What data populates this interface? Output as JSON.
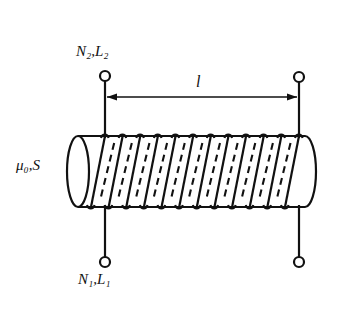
{
  "figure": {
    "kind": "solenoid-coil-schematic",
    "background_color": "#ffffff",
    "ink_color": "#111111",
    "labels": {
      "top_terminal": "N₂,L₂",
      "bottom_terminal": "N₁,L₁",
      "core": "μ₀,S",
      "length": "l"
    }
  },
  "geometry": {
    "cylinder": {
      "left_x": 67,
      "right_x": 310,
      "top_y": 136,
      "bottom_y": 207,
      "cap_rx": 11,
      "cap_ry": 36
    },
    "coil": {
      "turns": 12,
      "start_x": 105,
      "end_x": 299,
      "top_y": 136,
      "bottom_y": 207,
      "slant_dx": 14,
      "loop_radius": 4
    },
    "terminals": [
      {
        "name": "top-left",
        "cx": 105,
        "cy": 76,
        "r": 5
      },
      {
        "name": "top-right",
        "cx": 299,
        "cy": 77,
        "r": 5
      },
      {
        "name": "bottom-left",
        "cx": 105,
        "cy": 262,
        "r": 5
      },
      {
        "name": "bottom-right",
        "cx": 299,
        "cy": 262,
        "r": 5
      }
    ],
    "dimension_arrow": {
      "y": 97,
      "x1": 107,
      "x2": 297,
      "head_length": 9,
      "head_width": 4
    }
  },
  "chart_data": {
    "type": "diagram",
    "annotations": [
      {
        "id": "top-terminal-label",
        "text": "N₂,L₂",
        "x": 100,
        "y": 52
      },
      {
        "id": "bottom-terminal-label",
        "text": "N₁,L₁",
        "x": 102,
        "y": 280
      },
      {
        "id": "core-label",
        "text": "μ₀,S",
        "x": 38,
        "y": 166
      },
      {
        "id": "length-label",
        "text": "l",
        "x": 200,
        "y": 82
      }
    ],
    "elements": [
      "horizontal cylinder core drawn in perspective with open elliptical left end",
      "helical winding of 12 turns wrapped around the cylinder",
      "solid diagonal strokes represent front of each turn",
      "dashed diagonal strokes represent hidden rear of each turn",
      "four small open-circle terminals, two above and two below",
      "double headed dimension arrow spanning the winding length labelled l"
    ]
  }
}
